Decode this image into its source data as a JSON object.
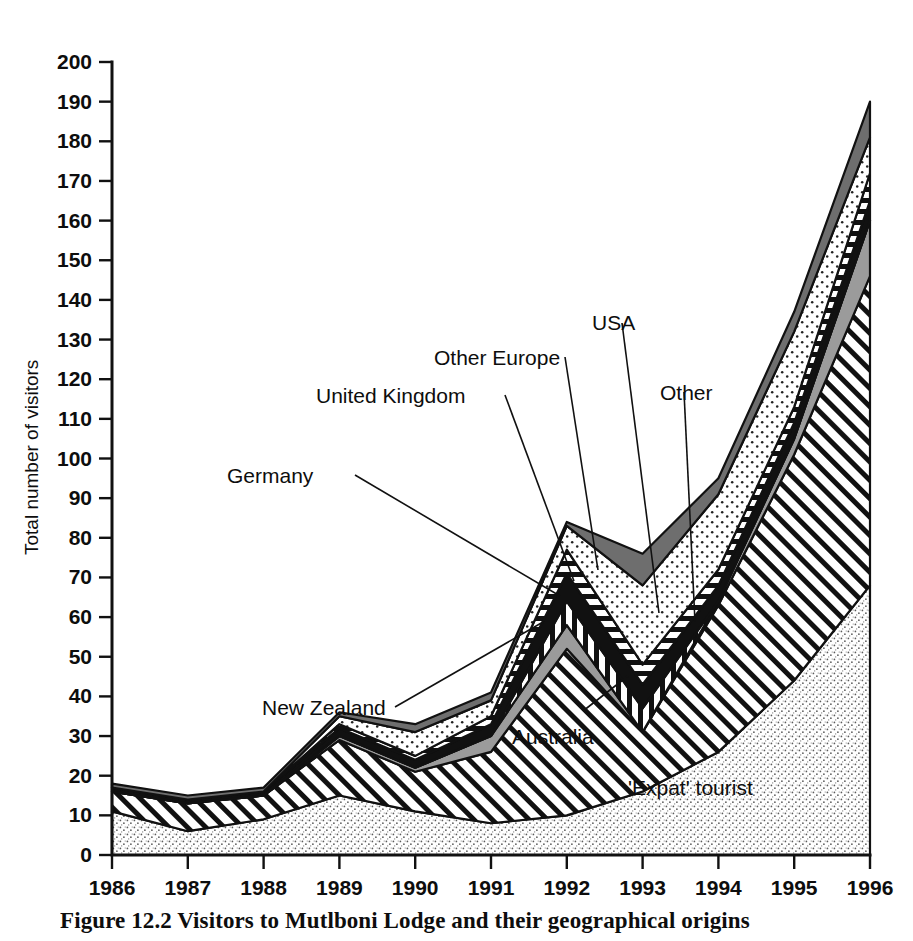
{
  "figure": {
    "caption": "Figure 12.2 Visitors to Mutlboni Lodge and their geographical origins"
  },
  "axes": {
    "y_title": "Total number of visitors",
    "y_ticks": [
      "0",
      "10",
      "20",
      "30",
      "40",
      "50",
      "60",
      "70",
      "80",
      "90",
      "100",
      "110",
      "120",
      "130",
      "140",
      "150",
      "160",
      "170",
      "180",
      "190",
      "200"
    ],
    "x_ticks": [
      "1986",
      "1987",
      "1988",
      "1989",
      "1990",
      "1991",
      "1992",
      "1993",
      "1994",
      "1995",
      "1996"
    ]
  },
  "annotations": [
    {
      "label": "New Zealand",
      "name": "annotation-new-zealand"
    },
    {
      "label": "Germany",
      "name": "annotation-germany"
    },
    {
      "label": "United Kingdom",
      "name": "annotation-united-kingdom"
    },
    {
      "label": "Other Europe",
      "name": "annotation-other-europe"
    },
    {
      "label": "USA",
      "name": "annotation-usa"
    },
    {
      "label": "Other",
      "name": "annotation-other"
    },
    {
      "label": "Australia",
      "name": "annotation-australia"
    },
    {
      "label": "'Expat' tourist",
      "name": "annotation-expat-tourist"
    }
  ],
  "chart_data": {
    "type": "area",
    "stacked": true,
    "title": "Figure 12.2 Visitors to Mutlboni Lodge and their geographical origins",
    "xlabel": "",
    "ylabel": "Total number of visitors",
    "xlim": [
      1986,
      1996
    ],
    "ylim": [
      0,
      200
    ],
    "grid": false,
    "legend": "inline-annotations",
    "x": [
      1986,
      1987,
      1988,
      1989,
      1990,
      1991,
      1992,
      1993,
      1994,
      1995,
      1996
    ],
    "tick_step_y": 10,
    "series": [
      {
        "name": "'Expat' tourist",
        "pattern": "stipple-light",
        "color": "#f0f0f0",
        "values": [
          11,
          6,
          9,
          15,
          11,
          8,
          10,
          16,
          26,
          44,
          68
        ]
      },
      {
        "name": "Australia",
        "pattern": "diagonal-hatch",
        "color": "#ffffff",
        "values": [
          5,
          7,
          6,
          14,
          10,
          18,
          42,
          15,
          37,
          57,
          78
        ]
      },
      {
        "name": "New Zealand",
        "pattern": "solid-gray",
        "color": "#9b9b9b",
        "values": [
          0,
          0,
          0,
          1,
          1,
          4,
          6,
          0,
          1,
          4,
          14
        ]
      },
      {
        "name": "Germany",
        "pattern": "vertical-stripes",
        "color": "#ffffff",
        "values": [
          0,
          0,
          0,
          0,
          0,
          0,
          6,
          6,
          0,
          0,
          0
        ]
      },
      {
        "name": "United Kingdom",
        "pattern": "solid-black",
        "color": "#111111",
        "values": [
          1,
          1,
          1,
          2,
          2,
          3,
          7,
          6,
          4,
          4,
          5
        ]
      },
      {
        "name": "Other Europe",
        "pattern": "horizontal-stripes",
        "color": "#ffffff",
        "values": [
          0,
          0,
          0,
          1,
          1,
          2,
          6,
          5,
          4,
          4,
          7
        ]
      },
      {
        "name": "USA",
        "pattern": "stipple-dots",
        "color": "#ededed",
        "values": [
          0,
          0,
          0,
          2,
          6,
          4,
          6,
          20,
          19,
          19,
          9
        ]
      },
      {
        "name": "Other",
        "pattern": "dark-gray",
        "color": "#6e6e6e",
        "values": [
          1,
          1,
          1,
          1,
          2,
          2,
          1,
          8,
          4,
          5,
          9
        ]
      }
    ],
    "totals": [
      18,
      15,
      17,
      36,
      33,
      41,
      84,
      76,
      95,
      137,
      190
    ]
  }
}
